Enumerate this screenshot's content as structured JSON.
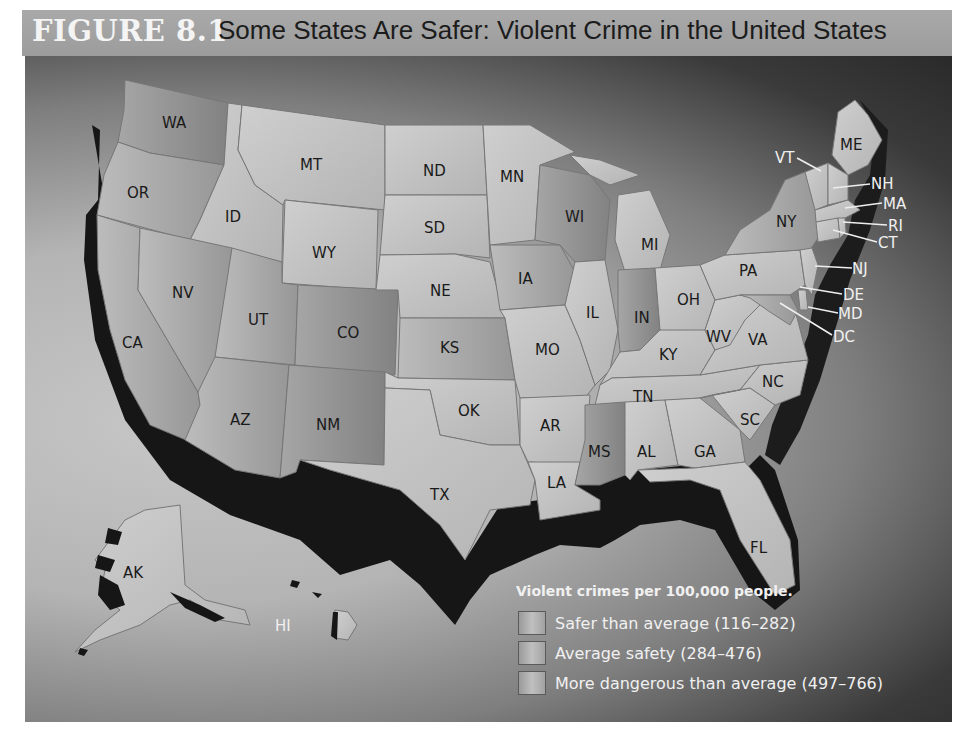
{
  "header": {
    "figure_number": "FIGURE 8.1",
    "title": "Some States Are Safer: Violent Crime in the United States"
  },
  "map": {
    "states": [
      {
        "abbr": "WA"
      },
      {
        "abbr": "OR"
      },
      {
        "abbr": "CA"
      },
      {
        "abbr": "ID"
      },
      {
        "abbr": "NV"
      },
      {
        "abbr": "MT"
      },
      {
        "abbr": "WY"
      },
      {
        "abbr": "UT"
      },
      {
        "abbr": "AZ"
      },
      {
        "abbr": "CO"
      },
      {
        "abbr": "NM"
      },
      {
        "abbr": "ND"
      },
      {
        "abbr": "SD"
      },
      {
        "abbr": "NE"
      },
      {
        "abbr": "KS"
      },
      {
        "abbr": "OK"
      },
      {
        "abbr": "TX"
      },
      {
        "abbr": "MN"
      },
      {
        "abbr": "IA"
      },
      {
        "abbr": "MO"
      },
      {
        "abbr": "AR"
      },
      {
        "abbr": "LA"
      },
      {
        "abbr": "WI"
      },
      {
        "abbr": "IL"
      },
      {
        "abbr": "MI"
      },
      {
        "abbr": "IN"
      },
      {
        "abbr": "OH"
      },
      {
        "abbr": "KY"
      },
      {
        "abbr": "TN"
      },
      {
        "abbr": "MS"
      },
      {
        "abbr": "AL"
      },
      {
        "abbr": "GA"
      },
      {
        "abbr": "FL"
      },
      {
        "abbr": "SC"
      },
      {
        "abbr": "NC"
      },
      {
        "abbr": "VA"
      },
      {
        "abbr": "WV"
      },
      {
        "abbr": "PA"
      },
      {
        "abbr": "NY"
      },
      {
        "abbr": "ME"
      },
      {
        "abbr": "VT"
      },
      {
        "abbr": "NH"
      },
      {
        "abbr": "MA"
      },
      {
        "abbr": "RI"
      },
      {
        "abbr": "CT"
      },
      {
        "abbr": "NJ"
      },
      {
        "abbr": "DE"
      },
      {
        "abbr": "MD"
      },
      {
        "abbr": "DC"
      },
      {
        "abbr": "AK"
      },
      {
        "abbr": "HI"
      }
    ],
    "colors": {
      "land_light": "#c4c4c4",
      "land_mid": "#a8a8a8",
      "land_dark": "#8e8e8e",
      "shadow": "#161616",
      "label": "#1a1a1a",
      "label_light": "#f0f0f0"
    }
  },
  "legend": {
    "title": "Violent crimes per 100,000 people.",
    "items": [
      {
        "label": "Safer than average (116–282)",
        "range": [
          116,
          282
        ]
      },
      {
        "label": "Average safety (284–476)",
        "range": [
          284,
          476
        ]
      },
      {
        "label": "More dangerous than average (497–766)",
        "range": [
          497,
          766
        ]
      }
    ]
  }
}
